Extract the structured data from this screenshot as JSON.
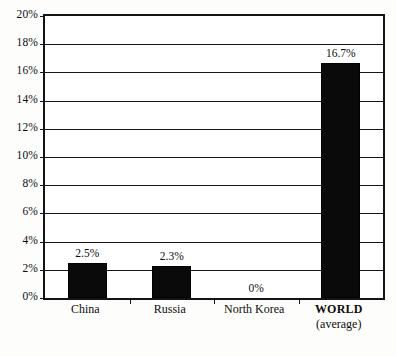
{
  "chart_data": {
    "type": "bar",
    "title": "",
    "subtitle": "",
    "xlabel": "",
    "ylabel": "",
    "categories": [
      "China",
      "Russia",
      "North Korea",
      "WORLD"
    ],
    "category_sublabels": [
      "",
      "",
      "",
      "(average)"
    ],
    "values": [
      2.5,
      2.3,
      0,
      16.7
    ],
    "value_labels": [
      "2.5%",
      "2.3%",
      "0%",
      "16.7%"
    ],
    "ylim": [
      0,
      20
    ],
    "ytick_step": 2,
    "ytick_labels": [
      "20%",
      "18%",
      "16%",
      "14%",
      "12%",
      "10%",
      "8%",
      "6%",
      "4%",
      "2%",
      "0%"
    ],
    "ytick_values": [
      20,
      18,
      16,
      14,
      12,
      10,
      8,
      6,
      4,
      2,
      0
    ],
    "grid": true,
    "legend": false,
    "bar_color": "#0a0a0a",
    "frame_color": "#141414",
    "background_color": "#ffffff"
  }
}
